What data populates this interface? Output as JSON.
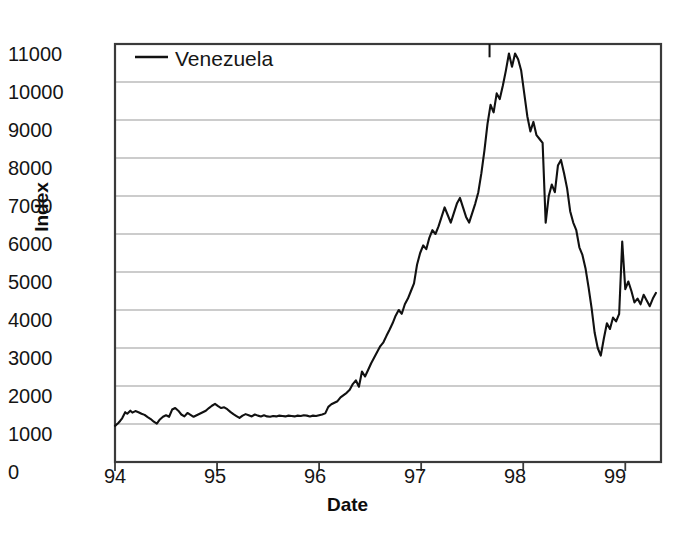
{
  "chart_data": {
    "type": "line",
    "title": "",
    "xlabel": "Date",
    "ylabel": "Index",
    "legend": [
      {
        "name": "Venezuela",
        "color": "#111111"
      }
    ],
    "legend_position": "top-left-inside",
    "grid": true,
    "grid_axis": "y",
    "xlim": [
      94,
      99.35
    ],
    "ylim": [
      0,
      11000
    ],
    "xticks": [
      94,
      95,
      96,
      97,
      98,
      99
    ],
    "xtick_labels": [
      "94",
      "95",
      "96",
      "97",
      "98",
      "99"
    ],
    "yticks": [
      0,
      1000,
      2000,
      3000,
      4000,
      5000,
      6000,
      7000,
      8000,
      9000,
      10000,
      11000
    ],
    "ytick_labels": [
      "0",
      "1000",
      "2000",
      "3000",
      "4000",
      "5000",
      "6000",
      "7000",
      "8000",
      "9000",
      "10000",
      "11000"
    ],
    "series": [
      {
        "name": "Venezuela",
        "color": "#111111",
        "x": [
          94.0,
          94.03,
          94.05,
          94.07,
          94.1,
          94.12,
          94.15,
          94.17,
          94.2,
          94.23,
          94.26,
          94.29,
          94.32,
          94.35,
          94.38,
          94.41,
          94.44,
          94.47,
          94.5,
          94.53,
          94.56,
          94.59,
          94.62,
          94.65,
          94.68,
          94.71,
          94.74,
          94.77,
          94.8,
          94.83,
          94.86,
          94.89,
          94.92,
          94.95,
          94.98,
          95.01,
          95.04,
          95.07,
          95.1,
          95.13,
          95.16,
          95.19,
          95.22,
          95.25,
          95.28,
          95.31,
          95.34,
          95.37,
          95.4,
          95.43,
          95.46,
          95.49,
          95.52,
          95.55,
          95.58,
          95.61,
          95.64,
          95.67,
          95.7,
          95.73,
          95.76,
          95.79,
          95.82,
          95.85,
          95.88,
          95.91,
          95.94,
          95.97,
          96.0,
          96.03,
          96.06,
          96.09,
          96.12,
          96.15,
          96.18,
          96.21,
          96.24,
          96.27,
          96.3,
          96.33,
          96.36,
          96.39,
          96.42,
          96.45,
          96.48,
          96.51,
          96.54,
          96.57,
          96.6,
          96.63,
          96.66,
          96.69,
          96.72,
          96.75,
          96.78,
          96.81,
          96.84,
          96.87,
          96.9,
          96.93,
          96.96,
          96.99,
          97.02,
          97.05,
          97.08,
          97.11,
          97.14,
          97.17,
          97.2,
          97.23,
          97.26,
          97.29,
          97.32,
          97.35,
          97.38,
          97.41,
          97.44,
          97.47,
          97.5,
          97.53,
          97.56,
          97.59,
          97.62,
          97.65,
          97.68,
          97.71,
          97.74,
          97.77,
          97.8,
          97.83,
          97.86,
          97.89,
          97.92,
          97.95,
          97.98,
          98.01,
          98.04,
          98.07,
          98.1,
          98.13,
          98.16,
          98.19,
          98.22,
          98.25,
          98.28,
          98.31,
          98.34,
          98.37,
          98.4,
          98.43,
          98.46,
          98.49,
          98.52,
          98.55,
          98.58,
          98.61,
          98.64,
          98.67,
          98.7,
          98.73,
          98.76,
          98.79,
          98.82,
          98.85,
          98.88,
          98.91,
          98.94,
          98.97,
          99.0,
          99.03,
          99.06,
          99.09,
          99.12,
          99.15,
          99.18,
          99.21,
          99.24,
          99.27,
          99.3
        ],
        "y": [
          950,
          1020,
          1080,
          1150,
          1310,
          1270,
          1350,
          1300,
          1340,
          1310,
          1270,
          1240,
          1180,
          1130,
          1060,
          1010,
          1120,
          1190,
          1230,
          1190,
          1380,
          1420,
          1350,
          1250,
          1200,
          1290,
          1240,
          1190,
          1230,
          1270,
          1310,
          1350,
          1420,
          1480,
          1530,
          1470,
          1420,
          1440,
          1390,
          1320,
          1260,
          1210,
          1160,
          1220,
          1260,
          1230,
          1200,
          1250,
          1220,
          1200,
          1230,
          1200,
          1190,
          1210,
          1200,
          1220,
          1210,
          1200,
          1220,
          1210,
          1200,
          1220,
          1210,
          1230,
          1220,
          1200,
          1220,
          1210,
          1230,
          1250,
          1280,
          1450,
          1520,
          1560,
          1600,
          1700,
          1760,
          1820,
          1900,
          2050,
          2150,
          1980,
          2380,
          2250,
          2420,
          2600,
          2750,
          2900,
          3050,
          3150,
          3320,
          3480,
          3650,
          3850,
          4000,
          3900,
          4150,
          4300,
          4500,
          4700,
          5200,
          5500,
          5700,
          5600,
          5900,
          6100,
          6000,
          6200,
          6450,
          6700,
          6500,
          6300,
          6550,
          6800,
          6950,
          6700,
          6450,
          6300,
          6550,
          6800,
          7100,
          7600,
          8200,
          8900,
          9400,
          9200,
          9700,
          9550,
          9900,
          10300,
          10750,
          10400,
          10750,
          10600,
          10300,
          9700,
          9100,
          8700,
          8950,
          8600,
          8500,
          8400,
          6300,
          7000,
          7300,
          7100,
          7800,
          7950,
          7600,
          7200,
          6600,
          6300,
          6100,
          5650,
          5450,
          5100,
          4600,
          4050,
          3400,
          3000,
          2800,
          3250,
          3650,
          3500,
          3800,
          3700,
          3900,
          5800,
          4550,
          4750,
          4500,
          4200,
          4300,
          4150,
          4400,
          4250,
          4100,
          4300,
          4450
        ]
      }
    ],
    "annotations": [
      {
        "name": "scan-artifact-tick",
        "x": 97.67,
        "y_top": 11000,
        "y_bottom": 10650
      }
    ]
  },
  "axes": {
    "ylabel": "Index",
    "xlabel": "Date"
  },
  "legend": {
    "entry_label": "Venezuela"
  },
  "ticks": {
    "y": [
      "11000",
      "10000",
      "9000",
      "8000",
      "7000",
      "6000",
      "5000",
      "4000",
      "3000",
      "2000",
      "1000",
      "0"
    ],
    "x": [
      "94",
      "95",
      "96",
      "97",
      "98",
      "99"
    ]
  },
  "colors": {
    "series": "#111111",
    "grid": "#9a9a9a",
    "frame": "#3a3a3a",
    "background": "#ffffff",
    "text": "#151515"
  }
}
